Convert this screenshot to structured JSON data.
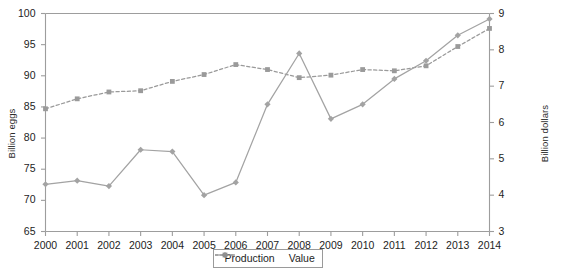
{
  "chart_data": {
    "type": "line",
    "title": "",
    "subtitle": "",
    "xlabel": "",
    "categories": [
      "2000",
      "2001",
      "2002",
      "2003",
      "2004",
      "2005",
      "2006",
      "2007",
      "2008",
      "2009",
      "2010",
      "2011",
      "2012",
      "2013",
      "2014"
    ],
    "grid": false,
    "legend_position": "bottom-center",
    "axes": {
      "left": {
        "label": "Billion eggs",
        "min": 65,
        "max": 100,
        "tick_step": 5,
        "ticks": [
          65,
          70,
          75,
          80,
          85,
          90,
          95,
          100
        ],
        "tick_labels": [
          "65",
          "70",
          "75",
          "80",
          "85",
          "90",
          "95",
          "100"
        ]
      },
      "right": {
        "label": "Billion dollars",
        "min": 3,
        "max": 9,
        "tick_step": 1,
        "ticks": [
          3,
          4,
          5,
          6,
          7,
          8,
          9
        ],
        "tick_labels": [
          "3",
          "4",
          "5",
          "6",
          "7",
          "8",
          "9"
        ]
      }
    },
    "series": [
      {
        "name": "Production",
        "axis": "left",
        "unit": "Billion eggs",
        "color": "#9a9a9a",
        "line_style": "dashed",
        "marker": "square",
        "values": [
          84.7,
          86.3,
          87.4,
          87.6,
          89.1,
          90.2,
          91.8,
          91.0,
          89.7,
          90.1,
          91.0,
          90.8,
          91.6,
          94.7,
          97.6
        ]
      },
      {
        "name": "Value",
        "axis": "right",
        "unit": "Billion dollars",
        "color": "#a3a3a3",
        "line_style": "solid",
        "marker": "diamond",
        "values": [
          4.3,
          4.4,
          4.25,
          5.25,
          5.2,
          4.0,
          4.35,
          6.5,
          7.9,
          6.1,
          6.5,
          7.2,
          7.7,
          8.4,
          8.85
        ]
      }
    ],
    "legend": [
      {
        "label": "Production",
        "marker": "square",
        "line_style": "dashed",
        "color": "#8f8f8f"
      },
      {
        "label": "Value",
        "marker": "diamond",
        "line_style": "solid",
        "color": "#8f8f8f"
      }
    ]
  }
}
